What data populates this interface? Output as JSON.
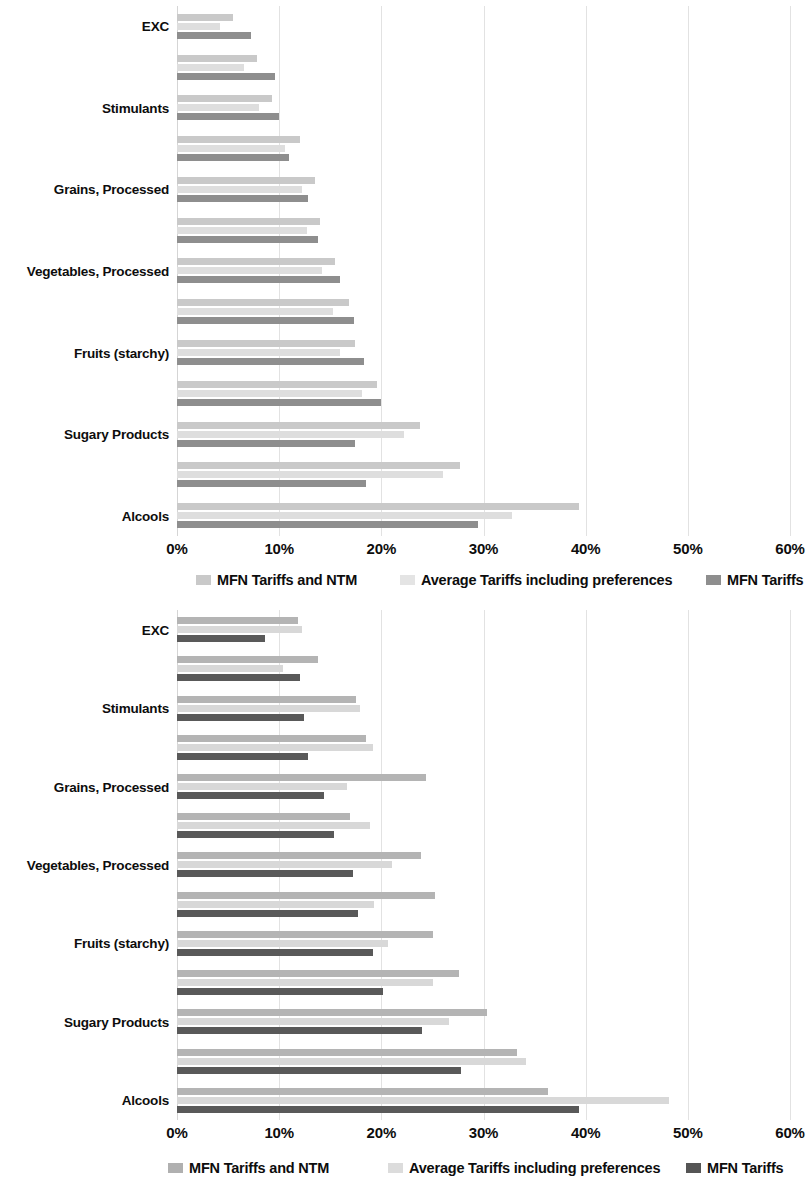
{
  "chart_data": [
    {
      "id": "top",
      "type": "bar",
      "orientation": "horizontal",
      "title": "",
      "xlabel": "",
      "ylabel": "",
      "xlim": [
        0,
        60
      ],
      "xticks": [
        "0%",
        "10%",
        "20%",
        "30%",
        "40%",
        "50%",
        "60%"
      ],
      "xtick_values": [
        0,
        10,
        20,
        30,
        40,
        50,
        60
      ],
      "grid": true,
      "legend_position": "bottom",
      "categories": [
        "EXC",
        "Leguminous",
        "Stimulants",
        "Nuts",
        "Grains, Processed",
        "Fish, Prepared",
        "Vegetables, Processed",
        "Fruits (non starchy)",
        "Fruits (starchy)",
        "Vegetables (non starchy)",
        "Sugary Products",
        "Dairy",
        "Alcools"
      ],
      "series": [
        {
          "name": "MFN Tariffs and NTM",
          "color": "#c9c9c9",
          "values": [
            5.5,
            7.8,
            9.3,
            12.0,
            13.5,
            14.0,
            15.5,
            16.8,
            17.4,
            19.6,
            23.8,
            27.7,
            39.3
          ]
        },
        {
          "name": "Average Tariffs including preferences",
          "color": "#dedede",
          "values": [
            4.2,
            6.6,
            8.0,
            10.6,
            12.2,
            12.7,
            14.2,
            15.3,
            16.0,
            18.1,
            22.2,
            26.0,
            32.8
          ]
        },
        {
          "name": "MFN Tariffs",
          "color": "#8e8e8e",
          "values": [
            7.2,
            9.6,
            10.0,
            11.0,
            12.8,
            13.8,
            16.0,
            17.3,
            18.3,
            20.0,
            17.4,
            18.5,
            29.5
          ]
        }
      ]
    },
    {
      "id": "bottom",
      "type": "bar",
      "orientation": "horizontal",
      "title": "",
      "xlabel": "",
      "ylabel": "",
      "xlim": [
        0,
        60
      ],
      "xticks": [
        "0%",
        "10%",
        "20%",
        "30%",
        "40%",
        "50%",
        "60%"
      ],
      "xtick_values": [
        0,
        10,
        20,
        30,
        40,
        50,
        60
      ],
      "grid": true,
      "legend_position": "bottom",
      "categories": [
        "EXC",
        "Leguminous",
        "Stimulants",
        "Nuts",
        "Grains, Processed",
        "Fish, Prepared",
        "Vegetables, Processed",
        "Fruits (non starchy)",
        "Fruits (starchy)",
        "Vegetables (non starchy)",
        "Sugary Products",
        "Dairy",
        "Alcools"
      ],
      "series": [
        {
          "name": "MFN Tariffs and NTM",
          "color": "#b4b4b4",
          "values": [
            11.8,
            13.8,
            17.5,
            18.5,
            24.4,
            16.9,
            23.9,
            25.3,
            25.1,
            27.6,
            30.3,
            33.3,
            36.3
          ]
        },
        {
          "name": "Average Tariffs including preferences",
          "color": "#d8d8d8",
          "values": [
            12.2,
            10.4,
            17.9,
            19.2,
            16.6,
            18.9,
            21.0,
            19.3,
            20.7,
            25.1,
            26.6,
            34.2,
            48.2
          ]
        },
        {
          "name": "MFN Tariffs",
          "color": "#595959",
          "values": [
            8.6,
            12.0,
            12.4,
            12.8,
            14.4,
            15.4,
            17.2,
            17.7,
            19.2,
            20.2,
            24.0,
            27.8,
            39.3
          ]
        }
      ]
    }
  ],
  "legend": {
    "items": [
      {
        "label": "MFN Tariffs and NTM"
      },
      {
        "label": "Average Tariffs including preferences"
      },
      {
        "label": "MFN Tariffs"
      }
    ]
  }
}
